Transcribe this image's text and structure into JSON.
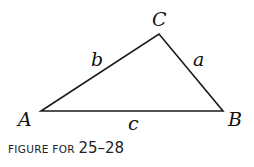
{
  "figure": {
    "vertices": {
      "A": "A",
      "B": "B",
      "C": "C"
    },
    "sides": {
      "a": "a",
      "b": "b",
      "c": "c"
    },
    "caption_prefix": "FIGURE FOR ",
    "caption_range": "25–28"
  },
  "colors": {
    "stroke": "#1a1a1a",
    "background": "#ffffff"
  }
}
